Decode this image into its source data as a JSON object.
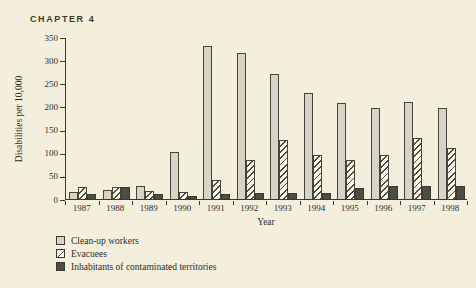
{
  "header": {
    "chapter_label": "CHAPTER 4"
  },
  "chart_data": {
    "type": "bar",
    "title": "",
    "xlabel": "Year",
    "ylabel": "Disabilities per 10,000",
    "ylim": [
      0,
      350
    ],
    "yticks": [
      0,
      50,
      100,
      150,
      200,
      250,
      300,
      350
    ],
    "grid": false,
    "legend_position": "bottom-left",
    "categories": [
      "1987",
      "1988",
      "1989",
      "1990",
      "1991",
      "1992",
      "1993",
      "1994",
      "1995",
      "1996",
      "1997",
      "1998"
    ],
    "series": [
      {
        "name": "Clean-up workers",
        "style": "solid-light",
        "values": [
          15,
          20,
          28,
          102,
          330,
          315,
          270,
          230,
          207,
          196,
          210,
          197
        ]
      },
      {
        "name": "Evacuees",
        "style": "hatched",
        "values": [
          25,
          27,
          17,
          15,
          42,
          85,
          127,
          95,
          85,
          95,
          131,
          110
        ]
      },
      {
        "name": "Inhabitants of contaminated territories",
        "style": "solid-dark",
        "values": [
          10,
          26,
          10,
          7,
          10,
          14,
          13,
          13,
          23,
          28,
          28,
          28
        ]
      }
    ],
    "colors": {
      "background": "#f3efdc",
      "bar_light": "#d5d4c7",
      "bar_dark": "#4e4d43",
      "hatch_line": "#4e4d43",
      "hatch_bg": "#fbf8ea",
      "axis": "#3a392f",
      "text": "#2e2d26"
    }
  }
}
